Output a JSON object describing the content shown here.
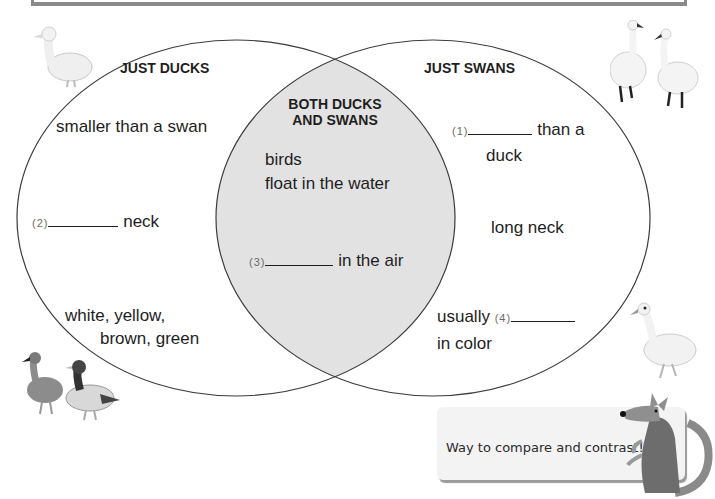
{
  "diagram": {
    "type": "venn",
    "left_set": {
      "title": "JUST DUCKS",
      "items": {
        "smaller": "smaller than a swan",
        "neck_num": "(2)",
        "neck_text": "neck",
        "color_line1": "white, yellow,",
        "color_line2": "brown, green"
      }
    },
    "overlap": {
      "title_line1": "BOTH DUCKS",
      "title_line2": "AND SWANS",
      "items": {
        "birds": "birds",
        "float": "float in the water",
        "air_num": "(3)",
        "air_text": "in the air"
      }
    },
    "right_set": {
      "title": "JUST SWANS",
      "items": {
        "bigger_num": "(1)",
        "bigger_text": "than a",
        "bigger_text2": "duck",
        "neck": "long neck",
        "color_prefix": "usually",
        "color_num": "(4)",
        "color_text": "in color"
      }
    },
    "colors": {
      "outline": "#3c3c3c",
      "overlap_fill": "#e2e2e2",
      "frame": "#8a8a8a"
    }
  },
  "speech_bubble": {
    "text": "Way to compare and contrast!"
  },
  "illustrations": [
    "white-duck",
    "two-swans",
    "two-mallard-ducks",
    "swan",
    "kangaroo-mascot"
  ]
}
